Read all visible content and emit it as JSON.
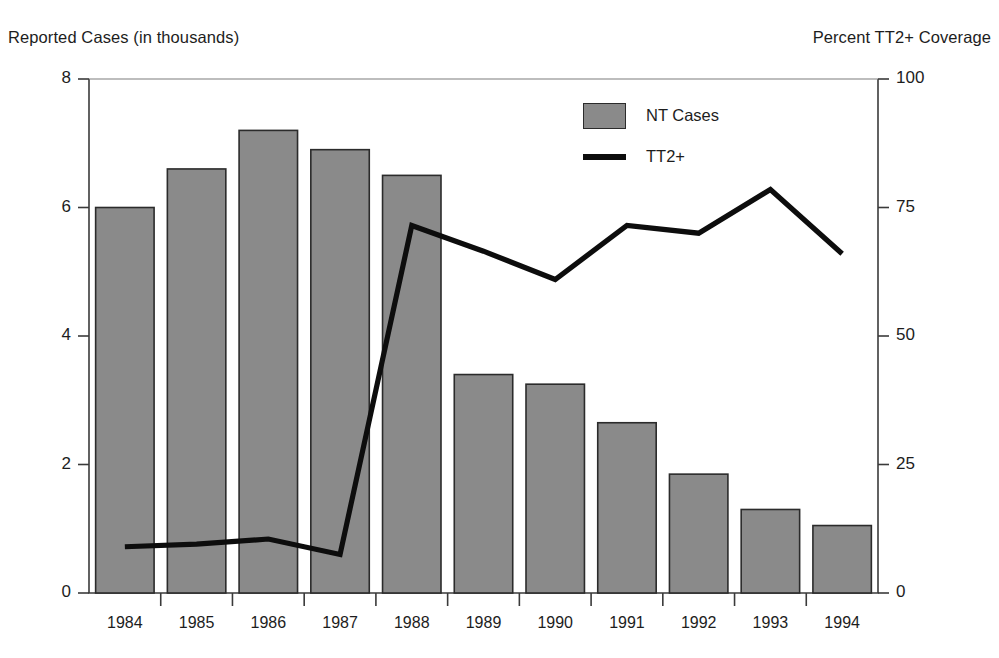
{
  "chart_data": {
    "type": "bar",
    "title": "",
    "subtitle": "",
    "categories": [
      "1984",
      "1985",
      "1986",
      "1987",
      "1988",
      "1989",
      "1990",
      "1991",
      "1992",
      "1993",
      "1994"
    ],
    "xlabel": "",
    "ylabel": "Reported Cases (in thousands)",
    "ylabel_right": "Percent TT2+ Coverage",
    "ylim": [
      0,
      8
    ],
    "ylim_right": [
      0,
      100
    ],
    "yticks": [
      "0",
      "2",
      "4",
      "6",
      "8"
    ],
    "yticks_right": [
      "0",
      "25",
      "50",
      "75",
      "100"
    ],
    "grid": false,
    "legend_position": "upper-center-right",
    "series": [
      {
        "name": "NT Cases",
        "type": "bar",
        "axis": "left",
        "color": "#8a8a8a",
        "edge_color": "#2b2b2b",
        "values": [
          6.0,
          6.6,
          7.2,
          6.9,
          6.5,
          3.4,
          3.25,
          2.65,
          1.85,
          1.3,
          1.05
        ]
      },
      {
        "name": "TT2+",
        "type": "line",
        "axis": "right",
        "color": "#0d0d0d",
        "values": [
          9,
          9.5,
          10.5,
          7.5,
          71.5,
          66.5,
          61,
          71.5,
          70,
          78.5,
          66
        ]
      }
    ]
  },
  "legend": {
    "items": [
      {
        "label": "NT Cases",
        "marker": "bar-swatch"
      },
      {
        "label": "TT2+",
        "marker": "line-swatch"
      }
    ]
  },
  "axes": {
    "left_title": "Reported Cases (in thousands)",
    "right_title": "Percent TT2+ Coverage"
  }
}
